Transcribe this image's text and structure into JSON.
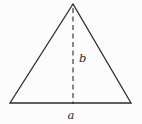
{
  "diagram": {
    "type": "isosceles-triangle-with-height",
    "base_label": "a",
    "height_label": "b",
    "line_color": "#2b2b2b",
    "background_color": "#fcfcfc",
    "height_line_style": "dashed"
  }
}
